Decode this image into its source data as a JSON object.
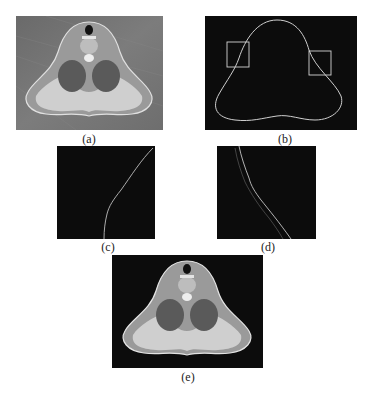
{
  "figure": {
    "panels": [
      {
        "id": "a",
        "label": "(a)",
        "description": "Original axial CT slice of neck with gray background"
      },
      {
        "id": "b",
        "label": "(b)",
        "description": "Extracted body contour on black background with two square regions of interest"
      },
      {
        "id": "c",
        "label": "(c)",
        "description": "Zoomed region of interest (left box) showing contour line"
      },
      {
        "id": "d",
        "label": "(d)",
        "description": "Zoomed region of interest (right box) showing contour line"
      },
      {
        "id": "e",
        "label": "(e)",
        "description": "Segmented axial CT slice with background removed (black)"
      }
    ]
  },
  "colors": {
    "background": "#ffffff",
    "panel_dark": "#0c0c0c",
    "panel_gray": "#6e6e6e",
    "contour": "#cfcfcf",
    "tissue_light": "#d8d8d8",
    "tissue_dark": "#4a4a4a"
  }
}
